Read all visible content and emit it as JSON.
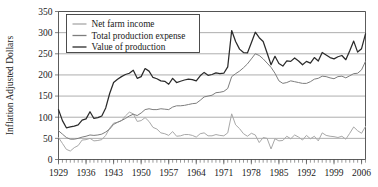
{
  "chart_data": {
    "type": "line",
    "title": "",
    "xlabel": "",
    "ylabel": "Inflation Adjusted Dollars",
    "xlim": [
      1929,
      2007
    ],
    "ylim": [
      0,
      350
    ],
    "grid": true,
    "legend_position": "top-left",
    "ytick_labels": [
      "0",
      "50",
      "100",
      "150",
      "200",
      "250",
      "300",
      "350"
    ],
    "yticks": [
      0,
      50,
      100,
      150,
      200,
      250,
      300,
      350
    ],
    "xtick_labels": [
      "1929",
      "1936",
      "1943",
      "1950",
      "1957",
      "1964",
      "1971",
      "1978",
      "1985",
      "1992",
      "1999",
      "2006"
    ],
    "xticks": [
      1929,
      1936,
      1943,
      1950,
      1957,
      1964,
      1971,
      1978,
      1985,
      1992,
      1999,
      2006
    ],
    "x_minor_tick_interval": 1,
    "x": [
      1929,
      1930,
      1931,
      1932,
      1933,
      1934,
      1935,
      1936,
      1937,
      1938,
      1939,
      1940,
      1941,
      1942,
      1943,
      1944,
      1945,
      1946,
      1947,
      1948,
      1949,
      1950,
      1951,
      1952,
      1953,
      1954,
      1955,
      1956,
      1957,
      1958,
      1959,
      1960,
      1961,
      1962,
      1963,
      1964,
      1965,
      1966,
      1967,
      1968,
      1969,
      1970,
      1971,
      1972,
      1973,
      1974,
      1975,
      1976,
      1977,
      1978,
      1979,
      1980,
      1981,
      1982,
      1983,
      1984,
      1985,
      1986,
      1987,
      1988,
      1989,
      1990,
      1991,
      1992,
      1993,
      1994,
      1995,
      1996,
      1997,
      1998,
      1999,
      2000,
      2001,
      2002,
      2003,
      2004,
      2005,
      2006,
      2007
    ],
    "series": [
      {
        "name": "Net farm income",
        "color": "#a8a8a8",
        "values": [
          52,
          38,
          24,
          20,
          28,
          33,
          46,
          47,
          50,
          44,
          45,
          47,
          57,
          74,
          86,
          88,
          92,
          103,
          112,
          108,
          90,
          92,
          99,
          90,
          76,
          72,
          63,
          61,
          57,
          66,
          55,
          56,
          59,
          59,
          57,
          53,
          61,
          63,
          56,
          56,
          59,
          57,
          56,
          63,
          108,
          82,
          73,
          61,
          55,
          62,
          58,
          40,
          52,
          50,
          25,
          49,
          44,
          45,
          55,
          49,
          58,
          53,
          46,
          57,
          49,
          55,
          44,
          63,
          57,
          55,
          54,
          52,
          55,
          48,
          62,
          77,
          68,
          62,
          78
        ]
      },
      {
        "name": "Total production expense",
        "color": "#7d7d7d",
        "values": [
          68,
          60,
          52,
          48,
          48,
          50,
          53,
          55,
          58,
          57,
          58,
          60,
          65,
          72,
          83,
          88,
          92,
          97,
          103,
          107,
          104,
          110,
          118,
          120,
          118,
          118,
          120,
          119,
          118,
          124,
          127,
          127,
          128,
          130,
          132,
          133,
          140,
          148,
          150,
          152,
          158,
          159,
          161,
          168,
          196,
          203,
          209,
          217,
          226,
          238,
          250,
          246,
          238,
          228,
          218,
          204,
          186,
          180,
          182,
          186,
          184,
          182,
          180,
          180,
          184,
          190,
          192,
          197,
          196,
          193,
          191,
          196,
          197,
          193,
          198,
          203,
          204,
          212,
          232
        ]
      },
      {
        "name": "Value of production",
        "color": "#2b2b2b",
        "values": [
          118,
          92,
          75,
          77,
          79,
          82,
          93,
          96,
          113,
          97,
          99,
          103,
          122,
          156,
          182,
          190,
          196,
          201,
          204,
          211,
          192,
          196,
          215,
          209,
          194,
          191,
          186,
          185,
          178,
          192,
          182,
          185,
          188,
          190,
          189,
          186,
          198,
          206,
          199,
          201,
          205,
          203,
          204,
          219,
          305,
          279,
          261,
          253,
          252,
          276,
          301,
          288,
          279,
          252,
          224,
          244,
          227,
          221,
          233,
          232,
          240,
          233,
          224,
          232,
          228,
          241,
          233,
          253,
          247,
          241,
          238,
          243,
          246,
          236,
          257,
          280,
          254,
          262,
          297
        ]
      }
    ]
  }
}
